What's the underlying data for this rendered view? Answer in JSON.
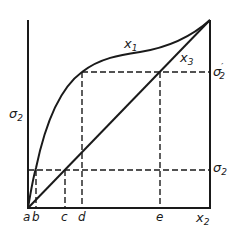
{
  "diagram": {
    "colors": {
      "stroke": "#1a1a1a",
      "background": "#ffffff"
    },
    "curves": [
      {
        "id": "x1",
        "label": "x",
        "subscript": "1",
        "kind": "s-shaped curve"
      },
      {
        "id": "x3",
        "label": "x",
        "subscript": "3",
        "kind": "straight diagonal"
      }
    ],
    "y_axis_label": {
      "base": "σ",
      "subscript": "2"
    },
    "x_axis_label": {
      "base": "x",
      "subscript": "2"
    },
    "right_labels": {
      "upper": {
        "base": "σ",
        "prime": "′",
        "subscript": "2"
      },
      "lower": {
        "base": "σ",
        "subscript": "2"
      }
    },
    "x_ticks": [
      "a",
      "b",
      "c",
      "d",
      "e"
    ]
  }
}
